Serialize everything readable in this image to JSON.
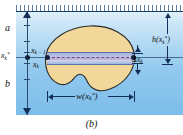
{
  "figure": {
    "caption": "(b)",
    "type": "integral-calculus-fluid-force-diagram",
    "colors": {
      "water_top": "#e3f1fa",
      "water_bottom": "#7cbdea",
      "lamina_fill": "#f2d79b",
      "lamina_stroke": "#2b2b2b",
      "strip_fill": "#c0bfe0",
      "strip_stroke": "#5d6fa5",
      "annotation": "#14305a",
      "background": "#ffffff"
    }
  },
  "labels": {
    "depth_upper": "a",
    "depth_lower": "b",
    "sample_point": "x",
    "sample_point_sub": "k",
    "sample_point_sup": "*",
    "partition_prev": "x",
    "partition_prev_sub": "k − 1",
    "partition_curr": "x",
    "partition_curr_sub": "k",
    "delta_x": "Δx",
    "delta_x_sub": "k",
    "height_fn": "h(x",
    "height_fn_sub": "k",
    "height_fn_sup": "*",
    "height_fn_close": ")",
    "width_fn": "w(x",
    "width_fn_sub": "k",
    "width_fn_sup": "*",
    "width_fn_close": ")"
  },
  "geometry": {
    "water_surface_y": 11,
    "axis_x": 27,
    "strip_y": 57,
    "strip_left_x": 47,
    "strip_right_x": 134,
    "blob_left": 44,
    "blob_right": 136,
    "blob_top": 25,
    "blob_bottom": 93
  }
}
